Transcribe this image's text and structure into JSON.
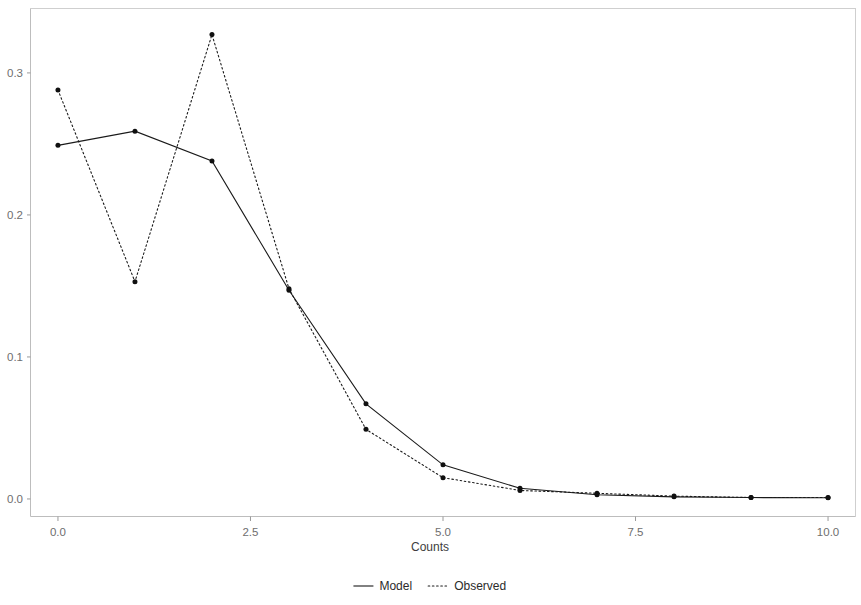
{
  "chart_data": {
    "type": "line",
    "title": "",
    "subtitle": "",
    "xlabel": "Counts",
    "ylabel": "",
    "x": [
      0,
      1,
      2,
      3,
      4,
      5,
      6,
      7,
      8,
      9,
      10
    ],
    "xlim": [
      -0.35,
      10.35
    ],
    "ylim": [
      -0.012,
      0.345
    ],
    "xticks": [
      0.0,
      2.5,
      5.0,
      7.5,
      10.0
    ],
    "xtick_labels": [
      "0.0",
      "2.5",
      "5.0",
      "7.5",
      "10.0"
    ],
    "yticks": [
      0.0,
      0.1,
      0.2,
      0.3
    ],
    "ytick_labels": [
      "0.0",
      "0.1",
      "0.2",
      "0.3"
    ],
    "grid": false,
    "legend_position": "bottom",
    "series": [
      {
        "name": "Model",
        "linestyle": "solid",
        "color": "#1a1a1a",
        "marker": "circle",
        "values": [
          0.249,
          0.259,
          0.238,
          0.147,
          0.067,
          0.024,
          0.0075,
          0.003,
          0.0015,
          0.001,
          0.0008
        ]
      },
      {
        "name": "Observed",
        "linestyle": "dotted",
        "color": "#1a1a1a",
        "marker": "circle",
        "values": [
          0.288,
          0.153,
          0.327,
          0.148,
          0.049,
          0.015,
          0.006,
          0.004,
          0.002,
          0.001,
          0.001
        ]
      }
    ]
  },
  "axes": {
    "x_title": "Counts",
    "y_title": ""
  },
  "legend": {
    "items": [
      {
        "label": "Model",
        "style": "solid"
      },
      {
        "label": "Observed",
        "style": "dotted"
      }
    ]
  },
  "colors": {
    "ink": "#1a1a1a",
    "panel_border": "#cfcfcf",
    "tick": "#9a9a9a",
    "tick_label": "#6e6e6e",
    "background": "#ffffff"
  }
}
